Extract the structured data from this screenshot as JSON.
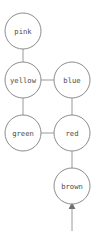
{
  "diagram": {
    "type": "node-link-graph",
    "canvas": {
      "width": 96,
      "height": 232
    },
    "style": {
      "background_color": "#ffffff",
      "node_fill": "#ffffff",
      "node_stroke": "#8c8c8c",
      "edge_color": "#9a9a9a",
      "label_color": "#4a4a4a",
      "arrow_color": "#6f6f6f",
      "node_radius": 18
    },
    "nodes": [
      {
        "id": "pink",
        "label": "pink",
        "x": 23,
        "y": 31,
        "r": 18
      },
      {
        "id": "yellow",
        "label": "yellow",
        "x": 23,
        "y": 80,
        "r": 18
      },
      {
        "id": "blue",
        "label": "blue",
        "x": 72,
        "y": 80,
        "r": 18
      },
      {
        "id": "green",
        "label": "green",
        "x": 23,
        "y": 133,
        "r": 18
      },
      {
        "id": "red",
        "label": "red",
        "x": 72,
        "y": 133,
        "r": 18
      },
      {
        "id": "brown",
        "label": "brown",
        "x": 72,
        "y": 186,
        "r": 18
      }
    ],
    "edges": [
      {
        "from": "pink",
        "to": "yellow",
        "orientation": "vertical",
        "x1": 23,
        "y1": 49,
        "x2": 23,
        "y2": 62
      },
      {
        "from": "yellow",
        "to": "blue",
        "orientation": "horizontal",
        "x1": 41,
        "y1": 80,
        "x2": 54,
        "y2": 80
      },
      {
        "from": "yellow",
        "to": "green",
        "orientation": "vertical",
        "x1": 23,
        "y1": 98,
        "x2": 23,
        "y2": 115
      },
      {
        "from": "blue",
        "to": "red",
        "orientation": "vertical",
        "x1": 72,
        "y1": 98,
        "x2": 72,
        "y2": 115
      },
      {
        "from": "green",
        "to": "red",
        "orientation": "horizontal",
        "x1": 41,
        "y1": 133,
        "x2": 54,
        "y2": 133
      },
      {
        "from": "red",
        "to": "brown",
        "orientation": "vertical",
        "x1": 72,
        "y1": 151,
        "x2": 72,
        "y2": 168
      }
    ],
    "arrows": [
      {
        "id": "incoming-arrow-brown",
        "target": "brown",
        "direction": "up",
        "tail_x": 72,
        "tail_y": 231,
        "head_x": 72,
        "head_y": 204,
        "description": "arrow pointing up into the brown node"
      }
    ]
  }
}
